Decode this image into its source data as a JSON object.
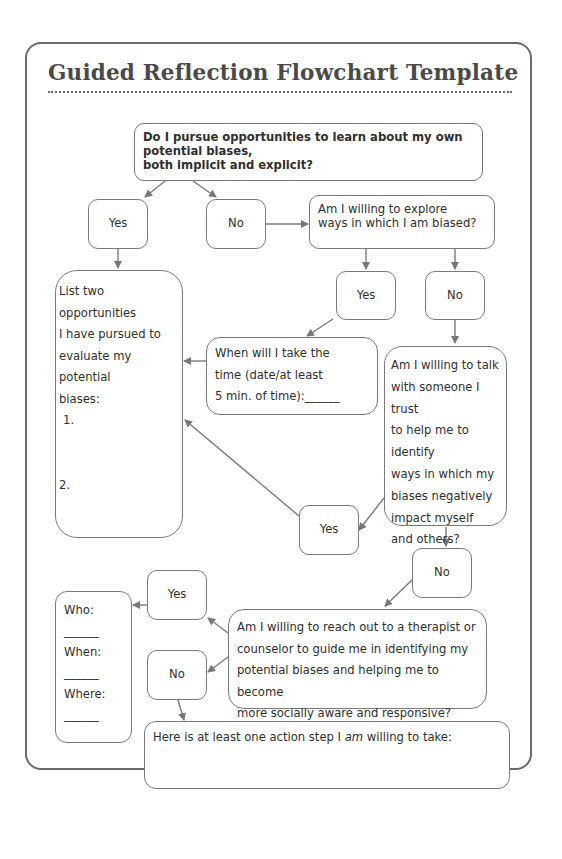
{
  "title": "Guided Reflection Flowchart Template",
  "colors": {
    "border": "#6b6b6b",
    "arrow": "#7a7a7a",
    "text": "#2e2e2e",
    "title": "#4a4a4a"
  },
  "nodes": {
    "q1": {
      "line1": "Do I pursue opportunities to learn about my own potential biases,",
      "line2": "both implicit and explicit?"
    },
    "q1_yes": "Yes",
    "q1_no": "No",
    "q2": {
      "line1": "Am I willing to explore",
      "line2": "ways in which I am biased?"
    },
    "q2_yes": "Yes",
    "q2_no": "No",
    "list": {
      "lines": [
        "List two opportunities",
        "I have pursued to",
        "evaluate my potential",
        "biases:"
      ],
      "item1": "1.",
      "item2": "2."
    },
    "when": {
      "lines": [
        "When will I take the",
        "time (date/at least",
        "5 min. of time):______"
      ]
    },
    "q3": {
      "lines": [
        "Am I willing to talk",
        "with someone I trust",
        "to help me to identify",
        "ways in which my",
        "biases negatively",
        "impact myself",
        "and others?"
      ]
    },
    "q3_yes": "Yes",
    "q3_no": "No",
    "q4": {
      "lines": [
        "Am I willing to reach out to a therapist or",
        "counselor to guide me in identifying my",
        "potential biases and helping me to become",
        "more socially aware and responsive?"
      ]
    },
    "q4_yes": "Yes",
    "q4_no": "No",
    "who": {
      "who_label": "Who:",
      "when_label": "When:",
      "where_label": "Where:",
      "blank": "______"
    },
    "action": {
      "prefix": "Here is at least one action step I ",
      "emph": "am",
      "suffix": " willing to take:"
    }
  }
}
